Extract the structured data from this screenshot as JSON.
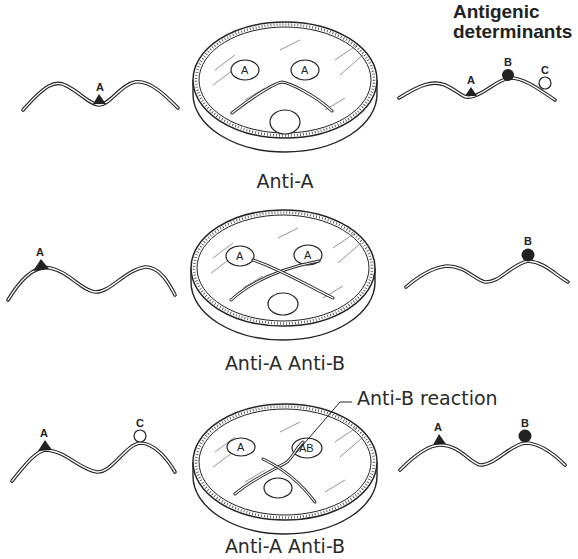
{
  "title": {
    "line1": "Antigenic",
    "line2": "determinants"
  },
  "panels": [
    {
      "caption": "Anti-A",
      "left_molecule": {
        "determinants": [
          "A"
        ]
      },
      "plate": {
        "wells": [
          "A",
          "A"
        ],
        "precipitin_pattern": "arc (identity)"
      },
      "right_molecule": {
        "determinants": [
          "A",
          "B",
          "C"
        ]
      }
    },
    {
      "caption": "Anti-A Anti-B",
      "left_molecule": {
        "determinants": [
          "A"
        ]
      },
      "plate": {
        "wells": [
          "A",
          "A"
        ],
        "precipitin_pattern": "crossed lines (non-identity)"
      },
      "right_molecule": {
        "determinants": [
          "B"
        ]
      }
    },
    {
      "caption": "Anti-A Anti-B",
      "annotation": "Anti-B reaction",
      "left_molecule": {
        "determinants": [
          "A",
          "C"
        ]
      },
      "plate": {
        "wells": [
          "A",
          "AB"
        ],
        "precipitin_pattern": "spur (partial identity)"
      },
      "right_molecule": {
        "determinants": [
          "A",
          "B"
        ]
      }
    }
  ],
  "labels": {
    "p1_left_A": "A",
    "p1_right_A": "A",
    "p1_right_B": "B",
    "p1_right_C": "C",
    "p1_well_left": "A",
    "p1_well_right": "A",
    "p2_left_A": "A",
    "p2_right_B": "B",
    "p2_well_left": "A",
    "p2_well_right": "A",
    "p3_left_A": "A",
    "p3_left_C": "C",
    "p3_right_A": "A",
    "p3_right_B": "B",
    "p3_well_left": "A",
    "p3_well_right": "AB"
  },
  "colors": {
    "ink": "#222222",
    "background": "#ffffff"
  }
}
